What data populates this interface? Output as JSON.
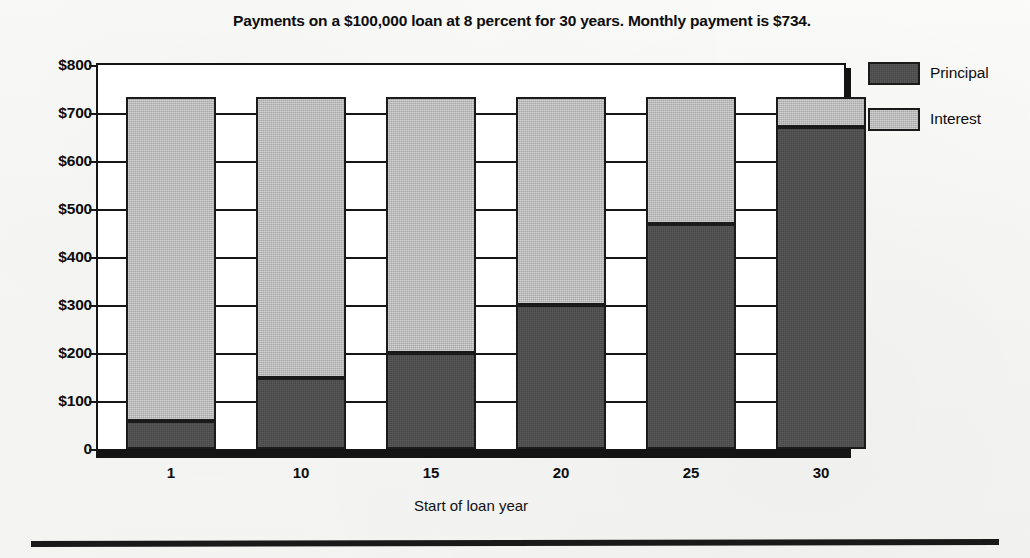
{
  "chart_data": {
    "type": "bar",
    "subtype": "stacked",
    "title": "Payments on a $100,000 loan at 8 percent for 30 years. Monthly payment is $734.",
    "xlabel": "Start of loan year",
    "ylabel": "",
    "categories": [
      "1",
      "10",
      "15",
      "20",
      "25",
      "30"
    ],
    "series": [
      {
        "name": "Principal",
        "values": [
          58,
          147,
          200,
          300,
          468,
          670
        ],
        "color": "#474747"
      },
      {
        "name": "Interest",
        "values": [
          676,
          587,
          534,
          434,
          266,
          64
        ],
        "color": "#a8a8a8"
      }
    ],
    "stack_totals": [
      734,
      734,
      734,
      734,
      734,
      734
    ],
    "ylim": [
      0,
      800
    ],
    "yticks": [
      0,
      100,
      200,
      300,
      400,
      500,
      600,
      700,
      800
    ],
    "ytick_labels": [
      "0",
      "$100",
      "$200",
      "$300",
      "$400",
      "$500",
      "$600",
      "$700",
      "$800"
    ],
    "grid": true,
    "grid_axis": "y",
    "legend_position": "right",
    "legend_entries": [
      "Principal",
      "Interest"
    ],
    "monthly_payment": "$734",
    "loan_amount": "$100,000",
    "interest_rate": "8 percent",
    "term_years": 30
  },
  "legend": {
    "items": [
      {
        "label": "Principal",
        "color": "#474747"
      },
      {
        "label": "Interest",
        "color": "#a8a8a8"
      }
    ]
  },
  "axes": {
    "y_labels": [
      "$800",
      "$700",
      "$600",
      "$500",
      "$400",
      "$300",
      "$200",
      "$100",
      "0"
    ],
    "x_labels": [
      "1",
      "10",
      "15",
      "20",
      "25",
      "30"
    ],
    "x_title": "Start of loan year"
  }
}
